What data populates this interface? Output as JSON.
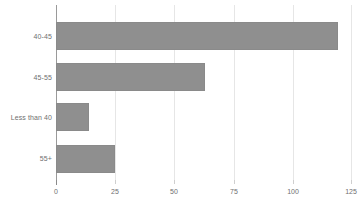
{
  "chart_data": {
    "type": "bar",
    "orientation": "horizontal",
    "title": "",
    "subtitle": "",
    "xlabel": "",
    "ylabel": "",
    "categories": [
      "40-45",
      "45-55",
      "Less than 40",
      "55+"
    ],
    "values": [
      119,
      63,
      14,
      25
    ],
    "series": [
      {
        "name": "",
        "values": [
          119,
          63,
          14,
          25
        ]
      }
    ],
    "xlim": [
      0,
      125
    ],
    "xticks": [
      0,
      25,
      50,
      75,
      100,
      125
    ],
    "xtick_labels": [
      "0",
      "25",
      "50",
      "75",
      "100",
      "125"
    ],
    "grid": true,
    "grid_axis": "x",
    "legend": false,
    "legend_position": "none",
    "bar_color": "#8f8f8f",
    "grid_color": "#e6e6e6",
    "axis_color": "#9a9a9a",
    "tick_label_color": "#6f6f6f",
    "background": "#ffffff"
  }
}
